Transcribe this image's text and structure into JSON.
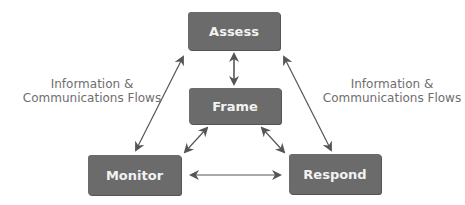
{
  "diagram": {
    "nodes": {
      "assess": {
        "label": "Assess"
      },
      "frame": {
        "label": "Frame"
      },
      "monitor": {
        "label": "Monitor"
      },
      "respond": {
        "label": "Respond"
      }
    },
    "annotations": {
      "left": {
        "line1": "Information &",
        "line2": "Communications Flows"
      },
      "right": {
        "line1": "Information &",
        "line2": "Communications Flows"
      }
    },
    "edges": [
      {
        "from": "assess",
        "to": "frame",
        "type": "bidirectional"
      },
      {
        "from": "assess",
        "to": "monitor",
        "type": "bidirectional"
      },
      {
        "from": "assess",
        "to": "respond",
        "type": "bidirectional"
      },
      {
        "from": "frame",
        "to": "monitor",
        "type": "bidirectional"
      },
      {
        "from": "frame",
        "to": "respond",
        "type": "bidirectional"
      },
      {
        "from": "monitor",
        "to": "respond",
        "type": "bidirectional"
      }
    ],
    "colors": {
      "node_fill": "#6b6b6b",
      "node_text": "#f2f2f2",
      "arrow": "#555555",
      "annotation_text": "#6e6e6e"
    }
  }
}
